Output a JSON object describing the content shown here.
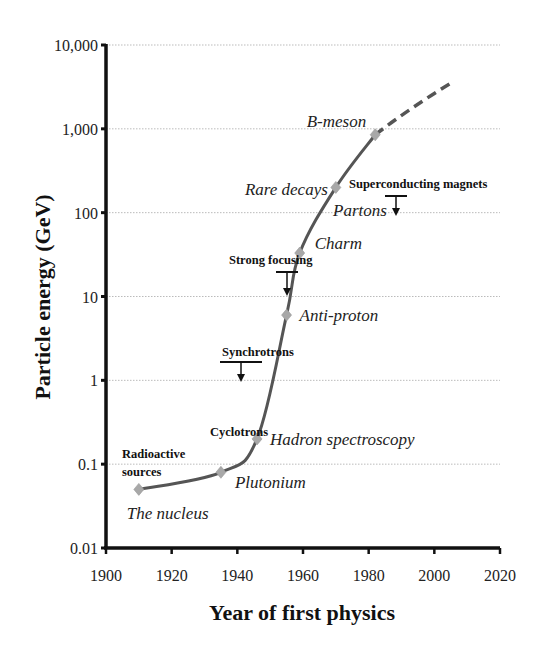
{
  "chart_data": {
    "type": "line",
    "title": "",
    "xlabel": "Year of first physics",
    "ylabel": "Particle energy (GeV)",
    "xlim": [
      1900,
      2020
    ],
    "ylim": [
      0.01,
      10000
    ],
    "yscale": "log",
    "x_ticks": [
      "1900",
      "1920",
      "1940",
      "1960",
      "1980",
      "2000",
      "2020"
    ],
    "y_ticks": [
      "0.01",
      "0.1",
      "1",
      "10",
      "100",
      "1,000",
      "10,000"
    ],
    "grid": "horizontal dotted gridlines at each decade",
    "legend": "none",
    "series": [
      {
        "name": "Milestones",
        "style": "solid line with diamond markers",
        "color": "#555555",
        "marker_color": "#a8a8a8",
        "points": [
          {
            "x": 1910,
            "y": 0.05,
            "label": "The nucleus"
          },
          {
            "x": 1935,
            "y": 0.08,
            "label": "Plutonium"
          },
          {
            "x": 1946,
            "y": 0.2,
            "label": "Hadron spectroscopy"
          },
          {
            "x": 1955,
            "y": 6,
            "label": "Anti-proton"
          },
          {
            "x": 1959,
            "y": 33,
            "label": "Charm"
          },
          {
            "x": 1970,
            "y": 200,
            "label": "Rare decays"
          },
          {
            "x": 1982,
            "y": 850,
            "label": "B-meson"
          }
        ]
      },
      {
        "name": "Extrapolation",
        "style": "dashed line",
        "color": "#555555",
        "points": [
          {
            "x": 1982,
            "y": 850
          },
          {
            "x": 2006,
            "y": 3700
          }
        ]
      }
    ],
    "annotations": [
      {
        "text": "Radioactive sources",
        "lines": [
          "Radioactive",
          "sources"
        ],
        "x": 1902,
        "y": 0.1
      },
      {
        "text": "Cyclotrons",
        "x": 1944,
        "y": 0.25
      },
      {
        "text": "Synchrotrons",
        "x": 1941,
        "y": 1.6,
        "arrow": "down"
      },
      {
        "text": "Strong focusing",
        "x": 1955,
        "y": 20,
        "arrow": "down"
      },
      {
        "text": "Superconducting magnets",
        "x": 1988,
        "y": 160,
        "arrow": "down"
      }
    ]
  }
}
